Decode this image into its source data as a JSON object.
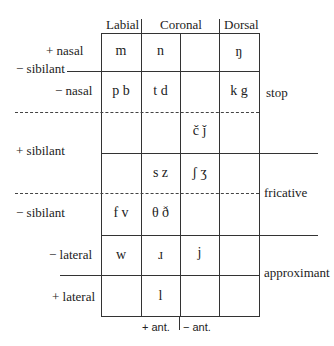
{
  "headers": {
    "labial": "Labial",
    "coronal": "Coronal",
    "dorsal": "Dorsal"
  },
  "row_labels": {
    "plus_nasal": "+ nasal",
    "minus_sibilant_top": "− sibilant",
    "minus_nasal": "− nasal",
    "plus_sibilant": "+ sibilant",
    "minus_sibilant_bottom": "− sibilant",
    "minus_lateral": "− lateral",
    "plus_lateral": "+ lateral"
  },
  "right_labels": {
    "stop": "stop",
    "fricative": "fricative",
    "approximant": "approximant"
  },
  "footer": {
    "plus_ant": "+ ant.",
    "minus_ant": "− ant."
  },
  "cells": {
    "r1": {
      "labial": "m",
      "cor_ant": "n",
      "cor_nonant": "",
      "dorsal": "ŋ"
    },
    "r2": {
      "labial": "p  b",
      "cor_ant": "t  d",
      "cor_nonant": "",
      "dorsal": "k  g"
    },
    "r3": {
      "labial": "",
      "cor_ant": "",
      "cor_nonant": "č  ǰ",
      "dorsal": ""
    },
    "r4": {
      "labial": "",
      "cor_ant": "s  z",
      "cor_nonant": "ʃ  ʒ",
      "dorsal": ""
    },
    "r5": {
      "labial": "f  v",
      "cor_ant": "θ  ð",
      "cor_nonant": "",
      "dorsal": ""
    },
    "r6": {
      "labial": "w",
      "cor_ant": "ɹ",
      "cor_nonant": "j",
      "dorsal": ""
    },
    "r7": {
      "labial": "",
      "cor_ant": "l",
      "cor_nonant": "",
      "dorsal": ""
    }
  }
}
